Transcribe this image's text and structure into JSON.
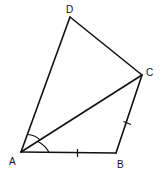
{
  "diagram": {
    "type": "geometry-quadrilateral",
    "points": {
      "A": {
        "label": "A",
        "x": 21,
        "y": 152,
        "label_x": 9,
        "label_y": 165
      },
      "B": {
        "label": "B",
        "x": 116,
        "y": 153,
        "label_x": 117,
        "label_y": 168
      },
      "C": {
        "label": "C",
        "x": 142,
        "y": 75,
        "label_x": 146,
        "label_y": 76
      },
      "D": {
        "label": "D",
        "x": 70,
        "y": 17,
        "label_x": 66,
        "label_y": 13
      }
    },
    "segments": [
      "AB",
      "BC",
      "CD",
      "DA",
      "AC"
    ],
    "equal_marks": [
      "AB",
      "BC"
    ],
    "angle_marks": [
      "DAC",
      "CAB"
    ],
    "stroke_color": "#111111",
    "background": "#ffffff"
  }
}
